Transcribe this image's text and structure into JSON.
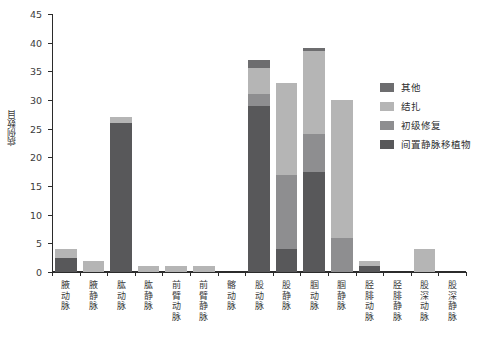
{
  "chart_data": {
    "type": "bar",
    "stacked": true,
    "title": "",
    "subtitle": "",
    "xlabel": "",
    "ylabel": "病例数目",
    "ylim": [
      0,
      45
    ],
    "yticks": [
      0,
      5,
      10,
      15,
      20,
      25,
      30,
      35,
      40,
      45
    ],
    "ytick_labels": [
      "0",
      "5",
      "10",
      "15",
      "20",
      "25",
      "30",
      "35",
      "40",
      "45"
    ],
    "grid": false,
    "legend_position": "right",
    "categories": [
      "腋动脉",
      "腋静脉",
      "肱动脉",
      "肱静脉",
      "前臂动脉",
      "前臂静脉",
      "髂动脉",
      "股动脉",
      "股静脉",
      "腘动脉",
      "腘静脉",
      "胫腓动脉",
      "胫腓静脉",
      "股深动脉",
      "股深静脉"
    ],
    "series": [
      {
        "name": "间置静脉移植物",
        "color": "#58585a",
        "values": [
          2.5,
          0,
          26,
          0,
          0,
          0,
          0,
          29,
          4,
          17.5,
          0,
          1,
          0,
          0,
          0
        ]
      },
      {
        "name": "初级修复",
        "color": "#8e8e90",
        "values": [
          0,
          0,
          0,
          0,
          0,
          0,
          0,
          2,
          13,
          6.5,
          6,
          0,
          0,
          0,
          0
        ]
      },
      {
        "name": "结扎",
        "color": "#b5b5b5",
        "values": [
          1.5,
          2,
          1,
          1,
          1,
          1,
          0,
          4.5,
          16,
          14.5,
          24,
          1,
          0,
          4,
          0
        ]
      },
      {
        "name": "其他",
        "color": "#6d6d6f",
        "values": [
          0,
          0,
          0,
          0,
          0,
          0,
          0,
          1.5,
          0,
          0.5,
          0,
          0,
          0,
          0,
          0
        ]
      }
    ],
    "totals": [
      4,
      2,
      27,
      1,
      1,
      1,
      0,
      37,
      33,
      39,
      30,
      2,
      0,
      4,
      0
    ]
  },
  "legend": {
    "items": [
      {
        "label": "其他",
        "color": "#6d6d6f"
      },
      {
        "label": "结扎",
        "color": "#b5b5b5"
      },
      {
        "label": "初级修复",
        "color": "#8e8e90"
      },
      {
        "label": "间置静脉移植物",
        "color": "#58585a"
      }
    ]
  },
  "axes": {
    "y_title": "病例数目",
    "y_tick_labels": [
      "0",
      "5",
      "10",
      "15",
      "20",
      "25",
      "30",
      "35",
      "40",
      "45"
    ],
    "x_tick_labels": [
      "腋动脉",
      "腋静脉",
      "肱动脉",
      "肱静脉",
      "前臂动脉",
      "前臂静脉",
      "髂动脉",
      "股动脉",
      "股静脉",
      "腘动脉",
      "腘静脉",
      "胫腓动脉",
      "胫腓静脉",
      "股深动脉",
      "股深静脉"
    ]
  },
  "colors": {
    "axis": "#2b2b2b",
    "text": "#3a3a3a",
    "background": "#ffffff"
  }
}
